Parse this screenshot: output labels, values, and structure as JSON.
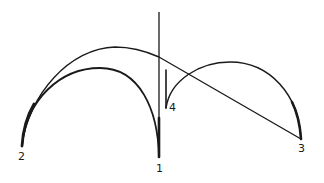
{
  "diagram": {
    "type": "arch-construction-sketch",
    "stroke_color": "#1a1a1a",
    "background": "#ffffff",
    "points": [
      {
        "id": "1",
        "label": "1",
        "x": 159,
        "y": 157
      },
      {
        "id": "2",
        "label": "2",
        "x": 22,
        "y": 146
      },
      {
        "id": "3",
        "label": "3",
        "x": 301,
        "y": 139
      },
      {
        "id": "4",
        "label": "4",
        "x": 166,
        "y": 108
      }
    ],
    "labels": {
      "p1": "1",
      "p2": "2",
      "p3": "3",
      "p4": "4"
    },
    "curves": [
      {
        "name": "outer-arc",
        "from": "2",
        "to": "3",
        "description": "large arc from 2 over the top, crossing the vertical axis and descending as a near-straight line to 3"
      },
      {
        "name": "inner-left-arch",
        "from": "2",
        "to": "1",
        "description": "semicircular arch springing from 2 and landing at 1"
      },
      {
        "name": "right-arch",
        "from": "4",
        "to": "3",
        "description": "arch springing from 4 and landing at 3"
      },
      {
        "name": "vertical-axis",
        "from": "top",
        "to": "1",
        "description": "vertical line through point 1"
      },
      {
        "name": "short-vertical",
        "from": "4",
        "to": "above-4",
        "description": "short vertical stroke at point 4"
      }
    ]
  }
}
